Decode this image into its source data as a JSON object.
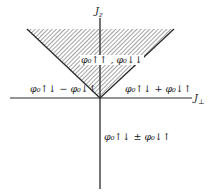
{
  "diagram": {
    "axes": {
      "vertical_label": "J_z",
      "vertical_label_main": "J",
      "vertical_label_sub": "z",
      "horizontal_label": "J_⊥",
      "horizontal_label_main": "J",
      "horizontal_label_sub": "⊥"
    },
    "regions": {
      "top_hatched": {
        "label": "φ₀↑↑, φ₀↓↓",
        "text": "φ₀↑↑ , φ₀↓↓"
      },
      "left": {
        "label": "φ₀↑↓ − φ₀↓↑",
        "text": "φ₀↑↓ − φ₀↓↑"
      },
      "right": {
        "label": "φ₀↑↓ + φ₀↓↑",
        "text": "φ₀↑↓ + φ₀↓↑"
      },
      "bottom": {
        "label": "φ₀↑↓ ± φ₀↓↑",
        "text": "φ₀↑↓ ± φ₀↓↑"
      }
    },
    "colors": {
      "line": "#2a2a2a",
      "hatch": "#555555",
      "background": "#ffffff"
    }
  }
}
